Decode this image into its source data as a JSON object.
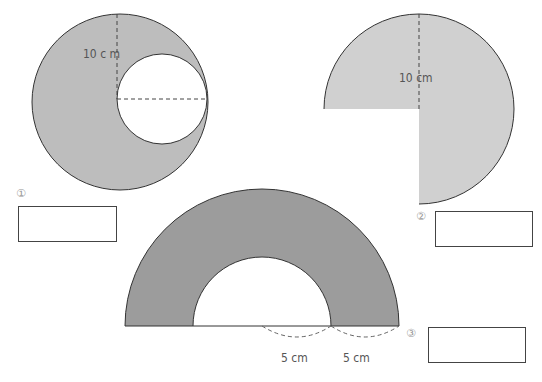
{
  "problems": [
    {
      "number": "①",
      "figure": "circle-with-inner-circle-removed",
      "label": "10 c m",
      "colors": {
        "fill": "#bdbdbd",
        "stroke": "#333333"
      }
    },
    {
      "number": "②",
      "figure": "three-quarter-circle",
      "label": "10 cm",
      "colors": {
        "fill": "#d0d0d0",
        "stroke": "#333333"
      }
    },
    {
      "number": "③",
      "figure": "half-annulus",
      "labels": [
        "5 cm",
        "5 cm"
      ],
      "colors": {
        "fill": "#9c9c9c",
        "stroke": "#333333"
      }
    }
  ]
}
